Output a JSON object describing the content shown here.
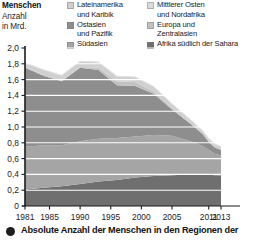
{
  "axis_title": {
    "line1": "Menschen",
    "line2": "Anzahl",
    "line3": "in Mrd."
  },
  "legend": {
    "column1": [
      {
        "label": "Lateinamerika\nund Karibik",
        "color": "#d0d0d0",
        "key": "lateinamerika-und-karibik"
      },
      {
        "label": "Ostasien\nund Pazifik",
        "color": "#8e8e8e",
        "key": "ostasien-und-pazifik"
      },
      {
        "label": "Südasien",
        "color": "#a5a5a5",
        "key": "suedasien"
      }
    ],
    "column2": [
      {
        "label": "Mittlerer Osten\nund Nordafrika",
        "color": "#dcdcdc",
        "key": "mittlerer-osten-und-nordafrika"
      },
      {
        "label": "Europa und\nZentralasien",
        "color": "#c2c2c2",
        "key": "europa-und-zentralasien"
      },
      {
        "label": "Afrika südlich der Sahara",
        "color": "#6f6f6f",
        "key": "afrika-suedlich-der-sahara"
      }
    ]
  },
  "caption": {
    "text": "Absolute Anzahl der Menschen in den Regionen der",
    "bullet": "bullet-icon"
  },
  "chart_data": {
    "type": "area",
    "stacked": true,
    "title": "Menschen Anzahl in Mrd.",
    "xlabel": "",
    "ylabel": "Menschen Anzahl in Mrd.",
    "ylim": [
      0,
      2.0
    ],
    "xlim": [
      1981,
      2013
    ],
    "grid": true,
    "grid_orientation": "horizontal",
    "legend_position": "top",
    "yticks": [
      "0",
      "0,2",
      "0,4",
      "0,6",
      "0,8",
      "1,0",
      "1,2",
      "1,4",
      "1,6",
      "1,8",
      "2,0"
    ],
    "ytick_values": [
      0,
      0.2,
      0.4,
      0.6,
      0.8,
      1.0,
      1.2,
      1.4,
      1.6,
      1.8,
      2.0
    ],
    "xticks": [
      "1981",
      "1985",
      "1990",
      "1995",
      "2000",
      "2005",
      "2011",
      "2013"
    ],
    "xtick_values": [
      1981,
      1985,
      1990,
      1995,
      2000,
      2005,
      2011,
      2013
    ],
    "x": [
      1981,
      1984,
      1987,
      1990,
      1993,
      1996,
      1999,
      2002,
      2005,
      2008,
      2010,
      2011,
      2012,
      2013
    ],
    "series": [
      {
        "name": "Afrika südlich der Sahara",
        "color": "#6f6f6f",
        "values": [
          0.21,
          0.23,
          0.25,
          0.28,
          0.31,
          0.33,
          0.36,
          0.38,
          0.39,
          0.4,
          0.4,
          0.4,
          0.39,
          0.39
        ]
      },
      {
        "name": "Südasien",
        "color": "#a5a5a5",
        "values": [
          0.54,
          0.54,
          0.52,
          0.54,
          0.54,
          0.53,
          0.52,
          0.52,
          0.5,
          0.42,
          0.36,
          0.31,
          0.27,
          0.25
        ]
      },
      {
        "name": "Ostasien und Pazifik",
        "color": "#8e8e8e",
        "values": [
          1.0,
          0.88,
          0.81,
          0.93,
          0.87,
          0.67,
          0.64,
          0.52,
          0.33,
          0.22,
          0.15,
          0.1,
          0.08,
          0.07
        ]
      },
      {
        "name": "Europa und Zentralasien",
        "color": "#c2c2c2",
        "values": [
          0.01,
          0.01,
          0.01,
          0.01,
          0.03,
          0.05,
          0.05,
          0.03,
          0.02,
          0.01,
          0.01,
          0.01,
          0.01,
          0.01
        ]
      },
      {
        "name": "Lateinamerika und Karibik",
        "color": "#d0d0d0",
        "values": [
          0.05,
          0.06,
          0.06,
          0.07,
          0.07,
          0.06,
          0.06,
          0.06,
          0.05,
          0.04,
          0.03,
          0.03,
          0.03,
          0.03
        ]
      },
      {
        "name": "Mittlerer Osten und Nordafrika",
        "color": "#dcdcdc",
        "values": [
          0.01,
          0.01,
          0.01,
          0.01,
          0.01,
          0.01,
          0.01,
          0.01,
          0.01,
          0.01,
          0.01,
          0.01,
          0.01,
          0.01
        ]
      }
    ],
    "totals": [
      1.82,
      1.73,
      1.66,
      1.84,
      1.83,
      1.65,
      1.64,
      1.52,
      1.3,
      1.1,
      0.96,
      0.86,
      0.79,
      0.76
    ]
  }
}
